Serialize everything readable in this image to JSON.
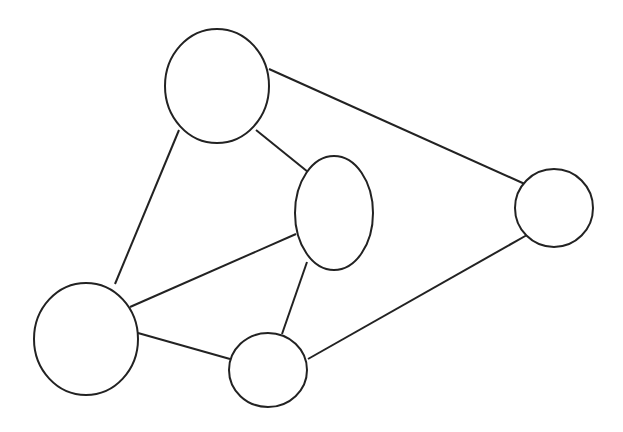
{
  "diagram": {
    "type": "undirected-graph",
    "stroke_color": "#222222",
    "background": "#ffffff",
    "nodes": [
      {
        "id": "n1",
        "label": "",
        "cx": 217,
        "cy": 86,
        "rx": 52,
        "ry": 57
      },
      {
        "id": "n2",
        "label": "",
        "cx": 334,
        "cy": 213,
        "rx": 39,
        "ry": 57
      },
      {
        "id": "n3",
        "label": "",
        "cx": 554,
        "cy": 208,
        "rx": 39,
        "ry": 39
      },
      {
        "id": "n4",
        "label": "",
        "cx": 86,
        "cy": 339,
        "rx": 52,
        "ry": 56
      },
      {
        "id": "n5",
        "label": "",
        "cx": 268,
        "cy": 370,
        "rx": 39,
        "ry": 37
      }
    ],
    "edges": [
      {
        "from": "n1",
        "to": "n3"
      },
      {
        "from": "n1",
        "to": "n2"
      },
      {
        "from": "n1",
        "to": "n4"
      },
      {
        "from": "n2",
        "to": "n4"
      },
      {
        "from": "n2",
        "to": "n5"
      },
      {
        "from": "n4",
        "to": "n5"
      },
      {
        "from": "n5",
        "to": "n3"
      }
    ]
  }
}
